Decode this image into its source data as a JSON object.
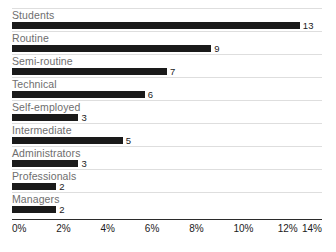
{
  "chart_data": {
    "type": "bar",
    "orientation": "horizontal",
    "title": "",
    "xlabel": "",
    "ylabel": "",
    "categories": [
      "Students",
      "Routine",
      "Semi-routine",
      "Technical",
      "Self-employed",
      "Intermediate",
      "Administrators",
      "Professionals",
      "Managers"
    ],
    "values": [
      13,
      9,
      7,
      6,
      3,
      5,
      3,
      2,
      2
    ],
    "value_labels": [
      "13",
      "9",
      "7",
      "6",
      "3",
      "5",
      "3",
      "2",
      "2"
    ],
    "value_unit": "%",
    "xlim": [
      0,
      14
    ],
    "xticks": [
      0,
      2,
      4,
      6,
      8,
      10,
      12,
      14
    ],
    "xtick_labels": [
      "0%",
      "2%",
      "4%",
      "6%",
      "8%",
      "10%",
      "12%",
      "14%"
    ],
    "grid": false,
    "row_separators": true,
    "legend": null,
    "colors": {
      "bar": "#1a1a1a",
      "category_label": "#6e6e6e",
      "value_label": "#1a1a1a",
      "separator": "#dedede",
      "axis_line": "#2b2b2b",
      "background": "#ffffff"
    }
  }
}
